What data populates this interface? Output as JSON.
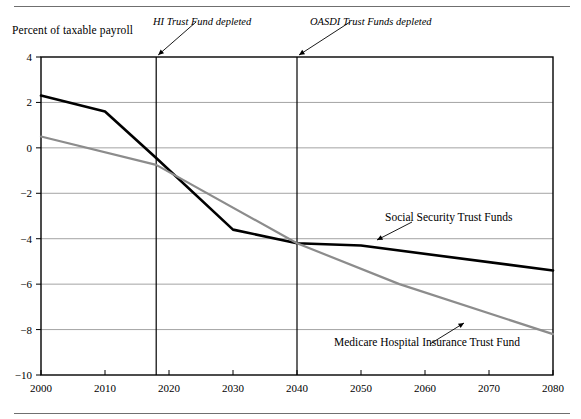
{
  "figure": {
    "y_axis_title": "Percent of taxable payroll",
    "annotations": [
      {
        "name": "hi-depleted",
        "text": "HI Trust Fund depleted",
        "year": 2018
      },
      {
        "name": "oasdi-depleted",
        "text": "OASDI Trust Funds depleted",
        "year": 2040
      }
    ],
    "series_labels": [
      {
        "name": "social-security",
        "text": "Social Security Trust Funds"
      },
      {
        "name": "medicare-hi",
        "text": "Medicare Hospital Insurance Trust Fund"
      }
    ]
  },
  "chart_data": {
    "type": "line",
    "title": "",
    "xlabel": "",
    "ylabel": "Percent of taxable payroll",
    "xlim": [
      2000,
      2080
    ],
    "ylim": [
      -10,
      4
    ],
    "xticks": [
      2000,
      2010,
      2020,
      2030,
      2040,
      2050,
      2060,
      2070,
      2080
    ],
    "xtick_labels": [
      "2000",
      "2010",
      "2020",
      "2030",
      "2040",
      "2050",
      "2060",
      "2070",
      "2080"
    ],
    "yticks": [
      4,
      2,
      0,
      -2,
      -4,
      -6,
      -8,
      -10
    ],
    "ytick_labels": [
      "4",
      "2",
      "0",
      "−2",
      "−4",
      "−6",
      "−8",
      "−10"
    ],
    "grid": "horizontal",
    "legend_position": "inline-annotations",
    "colors": {
      "social_security": "#000000",
      "medicare_hi": "#8c8c8c",
      "grid": "#9a9a9a",
      "frame": "#000000"
    },
    "vertical_markers": [
      {
        "label": "HI Trust Fund depleted",
        "x": 2018
      },
      {
        "label": "OASDI Trust Funds depleted",
        "x": 2040
      }
    ],
    "series": [
      {
        "name": "Social Security Trust Funds",
        "color": "#000000",
        "x": [
          2000,
          2010,
          2018,
          2030,
          2040,
          2050,
          2080
        ],
        "values": [
          2.3,
          1.6,
          -0.45,
          -3.6,
          -4.2,
          -4.3,
          -5.4
        ]
      },
      {
        "name": "Medicare Hospital Insurance Trust Fund",
        "color": "#8c8c8c",
        "x": [
          2000,
          2018,
          2040,
          2056,
          2080
        ],
        "values": [
          0.5,
          -0.75,
          -4.2,
          -6.0,
          -8.2
        ]
      }
    ]
  }
}
